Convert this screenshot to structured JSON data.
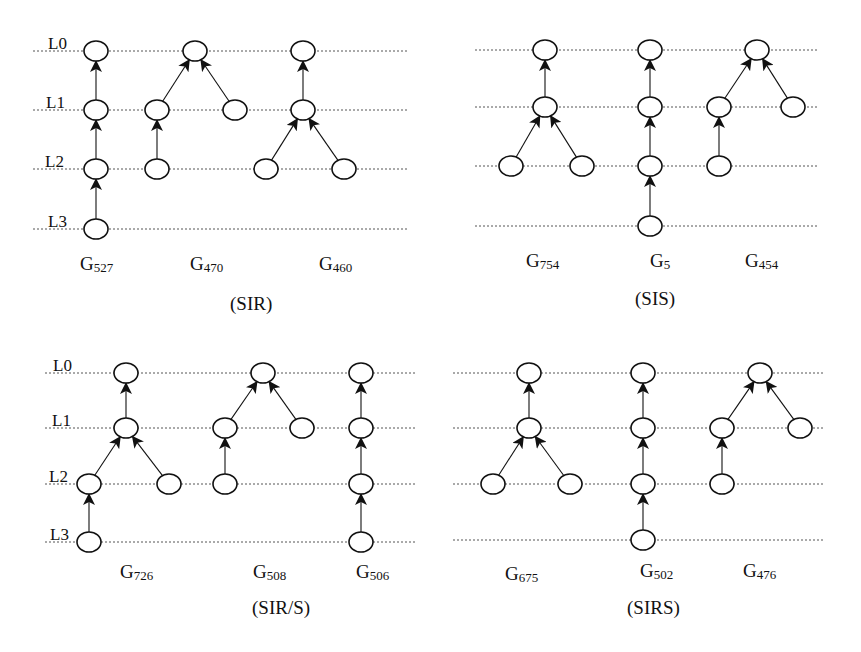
{
  "figure": {
    "level_labels": [
      "L0",
      "L1",
      "L2",
      "L3"
    ],
    "panels": [
      {
        "id": "sir",
        "caption": "(SIR)",
        "caption_pos": [
          230,
          310
        ],
        "show_level_labels": true,
        "level_label_x": [
          48,
          46,
          45,
          48
        ],
        "line_x": [
          33,
          407
        ],
        "levels_y": [
          51,
          110,
          169,
          229
        ],
        "graphs": [
          {
            "name": "G",
            "sub": "527",
            "label_pos": [
              80,
              270
            ],
            "nodes": [
              [
                96,
                0
              ],
              [
                96,
                1
              ],
              [
                96,
                2
              ],
              [
                96,
                3
              ]
            ],
            "edges": [
              [
                1,
                0
              ],
              [
                2,
                1
              ],
              [
                3,
                2
              ]
            ]
          },
          {
            "name": "G",
            "sub": "470",
            "label_pos": [
              190,
              270
            ],
            "nodes": [
              [
                195,
                0
              ],
              [
                157,
                1
              ],
              [
                235,
                1
              ],
              [
                157,
                2
              ]
            ],
            "edges": [
              [
                1,
                0
              ],
              [
                2,
                0
              ],
              [
                3,
                1
              ]
            ]
          },
          {
            "name": "G",
            "sub": "460",
            "label_pos": [
              319,
              270
            ],
            "nodes": [
              [
                303,
                0
              ],
              [
                303,
                1
              ],
              [
                266,
                2
              ],
              [
                344,
                2
              ]
            ],
            "edges": [
              [
                1,
                0
              ],
              [
                2,
                1
              ],
              [
                3,
                1
              ]
            ]
          }
        ]
      },
      {
        "id": "sis",
        "caption": "(SIS)",
        "caption_pos": [
          635,
          305
        ],
        "show_level_labels": false,
        "line_x": [
          475,
          817
        ],
        "levels_y": [
          50,
          107,
          166,
          226
        ],
        "graphs": [
          {
            "name": "G",
            "sub": "754",
            "label_pos": [
              526,
              267
            ],
            "nodes": [
              [
                545,
                0
              ],
              [
                545,
                1
              ],
              [
                511,
                2
              ],
              [
                582,
                2
              ]
            ],
            "edges": [
              [
                1,
                0
              ],
              [
                2,
                1
              ],
              [
                3,
                1
              ]
            ]
          },
          {
            "name": "G",
            "sub": "5",
            "label_pos": [
              650,
              267
            ],
            "nodes": [
              [
                650,
                0
              ],
              [
                650,
                1
              ],
              [
                650,
                2
              ],
              [
                650,
                3
              ]
            ],
            "edges": [
              [
                1,
                0
              ],
              [
                2,
                1
              ],
              [
                3,
                2
              ]
            ]
          },
          {
            "name": "G",
            "sub": "454",
            "label_pos": [
              745,
              267
            ],
            "nodes": [
              [
                757,
                0
              ],
              [
                719,
                1
              ],
              [
                793,
                1
              ],
              [
                719,
                2
              ]
            ],
            "edges": [
              [
                1,
                0
              ],
              [
                2,
                0
              ],
              [
                3,
                1
              ]
            ]
          }
        ]
      },
      {
        "id": "sir-s",
        "caption": "(SIR/S)",
        "caption_pos": [
          252,
          614
        ],
        "show_level_labels": true,
        "level_label_x": [
          53,
          52,
          49,
          50
        ],
        "line_x": [
          45,
          415
        ],
        "levels_y": [
          373,
          428,
          484,
          542
        ],
        "graphs": [
          {
            "name": "G",
            "sub": "726",
            "label_pos": [
              120,
              578
            ],
            "nodes": [
              [
                126,
                0
              ],
              [
                126,
                1
              ],
              [
                89,
                2
              ],
              [
                169,
                2
              ],
              [
                89,
                3
              ]
            ],
            "edges": [
              [
                1,
                0
              ],
              [
                2,
                1
              ],
              [
                3,
                1
              ],
              [
                4,
                2
              ]
            ]
          },
          {
            "name": "G",
            "sub": "508",
            "label_pos": [
              253,
              578
            ],
            "nodes": [
              [
                263,
                0
              ],
              [
                225,
                1
              ],
              [
                302,
                1
              ],
              [
                225,
                2
              ]
            ],
            "edges": [
              [
                1,
                0
              ],
              [
                2,
                0
              ],
              [
                3,
                1
              ]
            ]
          },
          {
            "name": "G",
            "sub": "506",
            "label_pos": [
              356,
              578
            ],
            "nodes": [
              [
                361,
                0
              ],
              [
                361,
                1
              ],
              [
                361,
                2
              ],
              [
                361,
                3
              ]
            ],
            "edges": [
              [
                1,
                0
              ],
              [
                2,
                1
              ],
              [
                3,
                2
              ]
            ]
          }
        ]
      },
      {
        "id": "sirs",
        "caption": "(SIRS)",
        "caption_pos": [
          627,
          614
        ],
        "show_level_labels": false,
        "line_x": [
          453,
          823
        ],
        "levels_y": [
          373,
          428,
          484,
          540
        ],
        "graphs": [
          {
            "name": "G",
            "sub": "675",
            "label_pos": [
              505,
              580
            ],
            "nodes": [
              [
                529,
                0
              ],
              [
                529,
                1
              ],
              [
                493,
                2
              ],
              [
                570,
                2
              ]
            ],
            "edges": [
              [
                1,
                0
              ],
              [
                2,
                1
              ],
              [
                3,
                1
              ]
            ]
          },
          {
            "name": "G",
            "sub": "502",
            "label_pos": [
              640,
              577
            ],
            "nodes": [
              [
                643,
                0
              ],
              [
                643,
                1
              ],
              [
                643,
                2
              ],
              [
                643,
                3
              ]
            ],
            "edges": [
              [
                1,
                0
              ],
              [
                2,
                1
              ],
              [
                3,
                2
              ]
            ]
          },
          {
            "name": "G",
            "sub": "476",
            "label_pos": [
              743,
              577
            ],
            "nodes": [
              [
                760,
                0
              ],
              [
                722,
                1
              ],
              [
                800,
                1
              ],
              [
                722,
                2
              ]
            ],
            "edges": [
              [
                1,
                0
              ],
              [
                2,
                0
              ],
              [
                3,
                1
              ]
            ]
          }
        ]
      }
    ]
  }
}
